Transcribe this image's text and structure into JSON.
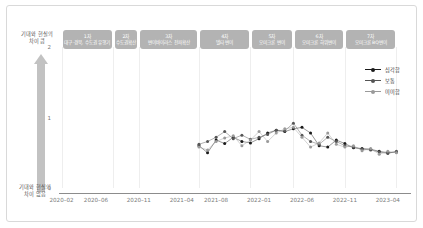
{
  "annotations": {
    "top_label": "기대와 현실의\n차이 큼",
    "bottom_label": "기대와 현실의\n차이 없음"
  },
  "phases": [
    {
      "num": "1차",
      "name": "대구·경북, 수도권 유행기",
      "start": "2020-02",
      "end": "2020-08"
    },
    {
      "num": "2차",
      "name": "수도권확산",
      "start": "2020-08",
      "end": "2020-11"
    },
    {
      "num": "3차",
      "name": "변이바이러스 전파확산",
      "start": "2020-11",
      "end": "2021-06"
    },
    {
      "num": "4차",
      "name": "델타 변이",
      "start": "2021-06",
      "end": "2021-12"
    },
    {
      "num": "5차",
      "name": "오미크론 변이",
      "start": "2021-12",
      "end": "2022-05"
    },
    {
      "num": "6차",
      "name": "오미크론 하위변이",
      "start": "2022-05",
      "end": "2022-11"
    },
    {
      "num": "7차",
      "name": "오미크론 BQ변이",
      "start": "2022-11",
      "end": "2023-05"
    }
  ],
  "legend": {
    "position": "top-right",
    "items": [
      {
        "label": "심각함",
        "color": "#1a1a1a",
        "marker": "filled-circle"
      },
      {
        "label": "보통",
        "color": "#555555",
        "marker": "filled-circle"
      },
      {
        "label": "미미함",
        "color": "#9a9a9a",
        "marker": "filled-circle"
      }
    ]
  },
  "chart_data": {
    "type": "line",
    "title": "",
    "subtitle": "",
    "xlabel": "",
    "ylabel": "기대와 현실의 차이",
    "grid": "vertical-only",
    "ylim": [
      0,
      2
    ],
    "yticks": [
      0,
      1,
      2
    ],
    "ytick_labels": [
      "0",
      "1",
      "2"
    ],
    "xlim": [
      "2020-01",
      "2023-06"
    ],
    "xtick_labels": [
      "2020-02",
      "2020-06",
      "2020-11",
      "2021-04",
      "2021-08",
      "2022-01",
      "2022-06",
      "2022-11",
      "2023-04"
    ],
    "x": [
      "2021-06",
      "2021-07",
      "2021-08",
      "2021-09",
      "2021-10",
      "2021-11",
      "2021-12",
      "2022-01",
      "2022-02",
      "2022-03",
      "2022-04",
      "2022-05",
      "2022-06",
      "2022-07",
      "2022-08",
      "2022-09",
      "2022-10",
      "2022-11",
      "2022-12",
      "2023-01",
      "2023-02",
      "2023-03",
      "2023-04",
      "2023-05"
    ],
    "series": [
      {
        "name": "심각함",
        "color": "#1a1a1a",
        "values": [
          0.6,
          0.5,
          0.68,
          0.63,
          0.72,
          0.66,
          0.64,
          0.7,
          0.78,
          0.82,
          0.8,
          0.84,
          0.86,
          0.78,
          0.6,
          0.58,
          0.68,
          0.63,
          0.57,
          0.56,
          0.55,
          0.52,
          0.5,
          0.51
        ]
      },
      {
        "name": "보통",
        "color": "#555555",
        "values": [
          0.62,
          0.66,
          0.72,
          0.8,
          0.7,
          0.75,
          0.69,
          0.72,
          0.76,
          0.82,
          0.81,
          0.92,
          0.75,
          0.66,
          0.62,
          0.72,
          0.66,
          0.6,
          0.58,
          0.55,
          0.54,
          0.51,
          0.49,
          0.52
        ]
      },
      {
        "name": "미미함",
        "color": "#9a9a9a",
        "values": [
          0.58,
          0.54,
          0.66,
          0.71,
          0.74,
          0.6,
          0.68,
          0.8,
          0.66,
          0.78,
          0.84,
          0.86,
          0.72,
          0.58,
          0.64,
          0.78,
          0.62,
          0.58,
          0.6,
          0.53,
          0.56,
          0.48,
          0.52,
          0.5
        ]
      }
    ]
  }
}
